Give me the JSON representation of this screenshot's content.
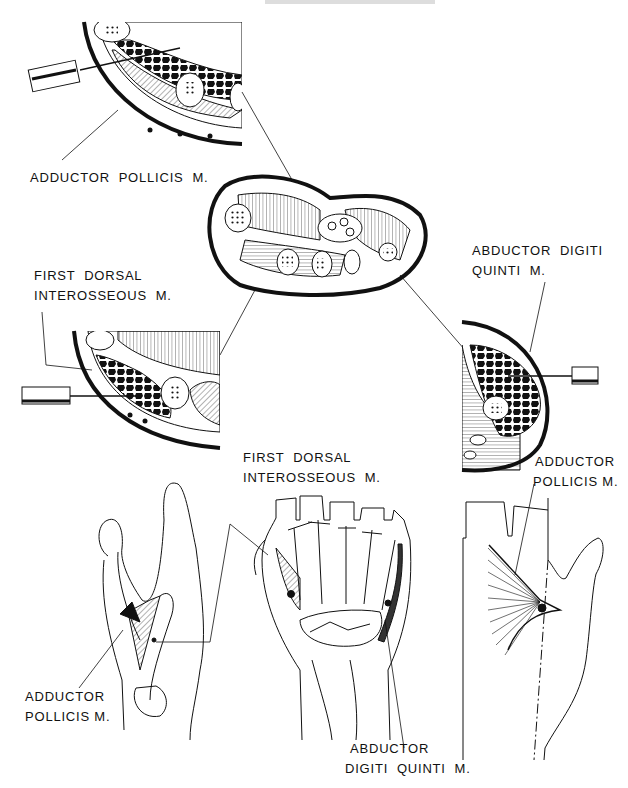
{
  "figure": {
    "title_partial": "ADDUCTOR POLLICIS",
    "background": "#ffffff",
    "ink": "#111111"
  },
  "labels": {
    "top_left": "ADDUCTOR  POLLICIS  M.",
    "mid_left_line1": "FIRST  DORSAL",
    "mid_left_line2": "INTEROSSEOUS  M.",
    "mid_right_line1": "ABDUCTOR  DIGITI",
    "mid_right_line2": "QUINTI  M.",
    "bottom_center_line1": "FIRST  DORSAL",
    "bottom_center_line2": "INTEROSSEOUS  M.",
    "bottom_right_line1": "ADDUCTOR",
    "bottom_right_line2": "POLLICIS M.",
    "bottom_left_line1": "ADDUCTOR",
    "bottom_left_line2": "POLLICIS M.",
    "bottom_abductor_line1": "ABDUCTOR",
    "bottom_abductor_line2": "DIGITI  QUINTI  M."
  },
  "panels": [
    {
      "name": "cross-section-adductor-pollicis",
      "needle": "left"
    },
    {
      "name": "cross-section-full-hand",
      "needle": "none"
    },
    {
      "name": "cross-section-first-dorsal-interosseous",
      "needle": "left"
    },
    {
      "name": "cross-section-abductor-digiti-quinti",
      "needle": "right"
    },
    {
      "name": "hand-lateral-thumb-view",
      "muscle": "adductor pollicis"
    },
    {
      "name": "hand-dorsal-skeleton-view",
      "muscles": [
        "first dorsal interosseous",
        "abductor digiti quinti"
      ]
    },
    {
      "name": "hand-palmar-thumb-view",
      "muscle": "adductor pollicis"
    }
  ]
}
